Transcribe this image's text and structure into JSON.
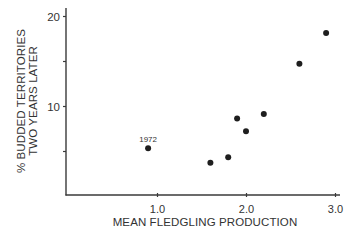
{
  "chart_data": {
    "type": "scatter",
    "title": "",
    "xlabel": "MEAN FLEDGLING PRODUCTION",
    "ylabel_lines": [
      "% BUDDED TERRITORIES",
      "TWO YEARS LATER"
    ],
    "xlim": [
      0,
      3.0
    ],
    "ylim": [
      0,
      20
    ],
    "x_ticks": [
      {
        "value": 1.0,
        "label": "1.0"
      },
      {
        "value": 2.0,
        "label": "2.0"
      },
      {
        "value": 3.0,
        "label": "3.0"
      }
    ],
    "y_ticks": [
      {
        "value": 20,
        "label": "20"
      },
      {
        "value": 15,
        "label": ""
      },
      {
        "value": 10,
        "label": "10"
      },
      {
        "value": 5,
        "label": ""
      }
    ],
    "grid": false,
    "legend": null,
    "points": [
      {
        "x": 0.9,
        "y": 5.3,
        "label": "1972"
      },
      {
        "x": 1.6,
        "y": 3.7,
        "label": ""
      },
      {
        "x": 1.8,
        "y": 4.3,
        "label": ""
      },
      {
        "x": 1.9,
        "y": 8.6,
        "label": ""
      },
      {
        "x": 2.0,
        "y": 7.2,
        "label": ""
      },
      {
        "x": 2.2,
        "y": 9.1,
        "label": ""
      },
      {
        "x": 2.6,
        "y": 14.7,
        "label": ""
      },
      {
        "x": 2.9,
        "y": 18.1,
        "label": ""
      }
    ],
    "annotations": [
      {
        "text": "1972",
        "x": 0.9,
        "y": 5.3
      }
    ],
    "colors": {
      "axis": "#3a3a3a",
      "marker": "#1e1e1e",
      "text": "#333333"
    }
  }
}
